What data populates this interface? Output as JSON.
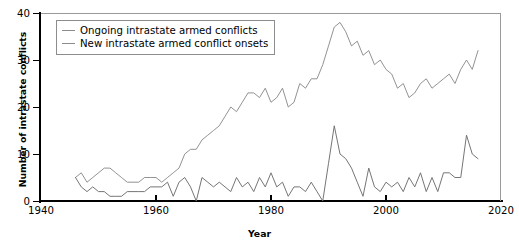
{
  "chart_data": {
    "type": "line",
    "title": "",
    "xlabel": "Year",
    "ylabel": "Number of intrastate conflicts",
    "xlim": [
      1940,
      2020
    ],
    "ylim": [
      0,
      40
    ],
    "xticks": [
      1940,
      1960,
      1980,
      2000,
      2020
    ],
    "yticks": [
      0,
      10,
      20,
      30,
      40
    ],
    "grid": false,
    "legend_position": "top-left",
    "x": [
      1946,
      1947,
      1948,
      1949,
      1950,
      1951,
      1952,
      1953,
      1954,
      1955,
      1956,
      1957,
      1958,
      1959,
      1960,
      1961,
      1962,
      1963,
      1964,
      1965,
      1966,
      1967,
      1968,
      1969,
      1970,
      1971,
      1972,
      1973,
      1974,
      1975,
      1976,
      1977,
      1978,
      1979,
      1980,
      1981,
      1982,
      1983,
      1984,
      1985,
      1986,
      1987,
      1988,
      1989,
      1990,
      1991,
      1992,
      1993,
      1994,
      1995,
      1996,
      1997,
      1998,
      1999,
      2000,
      2001,
      2002,
      2003,
      2004,
      2005,
      2006,
      2007,
      2008,
      2009,
      2010,
      2011,
      2012,
      2013,
      2014,
      2015,
      2016
    ],
    "series": [
      {
        "name": "Ongoing intrastate armed conflicts",
        "color": "#8c8c8c",
        "values": [
          5,
          6,
          4,
          5,
          6,
          7,
          7,
          6,
          5,
          4,
          4,
          4,
          5,
          5,
          5,
          4,
          5,
          6,
          7,
          10,
          11,
          11,
          13,
          14,
          15,
          16,
          18,
          20,
          19,
          21,
          23,
          23,
          22,
          24,
          21,
          22,
          24,
          20,
          21,
          25,
          24,
          26,
          26,
          29,
          33,
          37,
          38,
          36,
          33,
          34,
          31,
          32,
          29,
          30,
          28,
          27,
          24,
          25,
          22,
          23,
          25,
          26,
          24,
          25,
          26,
          27,
          25,
          28,
          30,
          28,
          32
        ]
      },
      {
        "name": "New intrastate armed conflict onsets",
        "color": "#6e6e6e",
        "values": [
          5,
          3,
          2,
          3,
          2,
          2,
          1,
          1,
          1,
          2,
          2,
          2,
          2,
          3,
          3,
          3,
          4,
          1,
          4,
          5,
          3,
          0,
          5,
          4,
          3,
          4,
          3,
          2,
          5,
          3,
          4,
          2,
          5,
          3,
          6,
          3,
          4,
          1,
          3,
          3,
          2,
          4,
          2,
          0,
          8,
          16,
          10,
          9,
          7,
          4,
          1,
          7,
          3,
          2,
          4,
          3,
          4,
          2,
          5,
          3,
          6,
          2,
          5,
          2,
          6,
          6,
          5,
          5,
          14,
          10,
          9
        ]
      }
    ]
  },
  "legend": {
    "items": [
      {
        "label": "Ongoing intrastate armed conflicts"
      },
      {
        "label": "New intrastate armed conflict onsets"
      }
    ]
  },
  "axes": {
    "x_tick_labels": [
      "1940",
      "1960",
      "1980",
      "2000",
      "2020"
    ],
    "y_tick_labels": [
      "0",
      "10",
      "20",
      "30",
      "40"
    ],
    "x_title": "Year",
    "y_title": "Number of intrastate conflicts"
  },
  "colors": {
    "ongoing_line": "#8c8c8c",
    "onsets_line": "#6e6e6e",
    "axis": "#000000",
    "frame": "#9a9a9a",
    "background": "#ffffff"
  }
}
